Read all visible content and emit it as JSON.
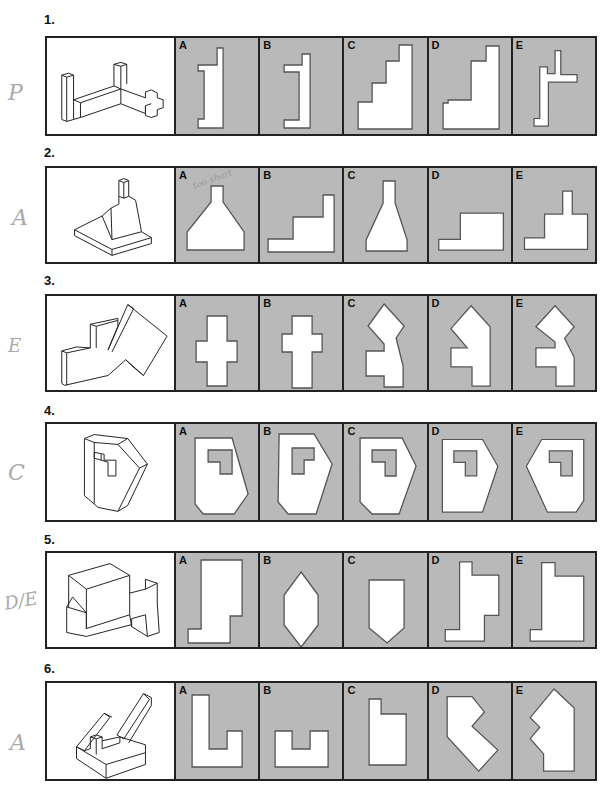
{
  "questions": [
    {
      "number": "1.",
      "options": [
        "A",
        "B",
        "C",
        "D",
        "E"
      ],
      "handwritten_answer": "P"
    },
    {
      "number": "2.",
      "options": [
        "A",
        "B",
        "C",
        "D",
        "E"
      ],
      "handwritten_answer": "A",
      "handwritten_notes": [
        "too short",
        "too long"
      ]
    },
    {
      "number": "3.",
      "options": [
        "A",
        "B",
        "C",
        "D",
        "E"
      ],
      "handwritten_answer": "E"
    },
    {
      "number": "4.",
      "options": [
        "A",
        "B",
        "C",
        "D",
        "E"
      ],
      "handwritten_answer": "C"
    },
    {
      "number": "5.",
      "options": [
        "A",
        "B",
        "C",
        "D",
        "E"
      ],
      "handwritten_answer": "D/E"
    },
    {
      "number": "6.",
      "options": [
        "A",
        "B",
        "C",
        "D",
        "E"
      ],
      "handwritten_answer": "A"
    }
  ],
  "colors": {
    "option_bg": "#b9b9b9",
    "border": "#222222",
    "shape_fill": "#ffffff"
  }
}
